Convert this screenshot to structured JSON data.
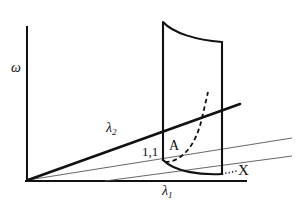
{
  "figure": {
    "type": "line-diagram",
    "background_color": "#ffffff",
    "stroke_color": "#111111",
    "thin_stroke_color": "#555555",
    "width": 301,
    "height": 207,
    "labels": {
      "y_axis": "ω",
      "x_axis": "λ",
      "x_axis_subscript": "1",
      "lambda2": "λ",
      "lambda2_subscript": "2",
      "point_one_one": "1,1",
      "point_a": "A",
      "point_x": "X"
    },
    "elements": [
      {
        "name": "y-axis",
        "kind": "line",
        "style": "solid-thick",
        "from": [
          27,
          27
        ],
        "to": [
          27,
          181
        ]
      },
      {
        "name": "x-axis",
        "kind": "line",
        "style": "solid-thick",
        "from": [
          27,
          181
        ],
        "to": [
          246,
          181
        ]
      },
      {
        "name": "lambda2-line",
        "kind": "line",
        "style": "solid-thick",
        "from": [
          27,
          181
        ],
        "to": [
          240,
          104
        ]
      },
      {
        "name": "thin-ray-upper",
        "kind": "line",
        "style": "solid-thin",
        "from": [
          27,
          181
        ],
        "to": [
          292,
          138
        ]
      },
      {
        "name": "thin-ray-lower",
        "kind": "line",
        "style": "solid-thin",
        "from": [
          105,
          181
        ],
        "to": [
          292,
          156
        ]
      },
      {
        "name": "surface-left-edge",
        "kind": "line",
        "style": "solid-thick",
        "from": [
          163,
          22
        ],
        "to": [
          163,
          160
        ]
      },
      {
        "name": "surface-right-edge",
        "kind": "line",
        "style": "solid-thick",
        "from": [
          222,
          42
        ],
        "to": [
          222,
          174
        ]
      },
      {
        "name": "surface-top-curve",
        "kind": "curve",
        "style": "solid-thick",
        "from": [
          163,
          22
        ],
        "to": [
          222,
          42
        ]
      },
      {
        "name": "surface-bottom-curve",
        "kind": "curve",
        "style": "solid-thick",
        "from": [
          163,
          160
        ],
        "to": [
          222,
          174
        ]
      },
      {
        "name": "fold-curve",
        "kind": "curve",
        "style": "dashed",
        "from": [
          165,
          161
        ],
        "to": [
          208,
          92
        ]
      },
      {
        "name": "x-leader",
        "kind": "line",
        "style": "dotted",
        "from": [
          222,
          174
        ],
        "to": [
          237,
          172
        ]
      }
    ]
  }
}
